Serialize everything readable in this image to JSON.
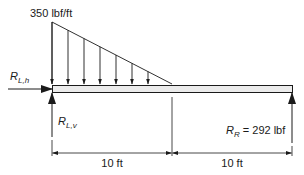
{
  "diagram": {
    "load": {
      "label": "350 lbf/ft",
      "peak_value": 350,
      "unit": "lbf/ft",
      "shape": "triangular, decreasing left to right",
      "arrow_count": 8
    },
    "reactions": {
      "left_horizontal": {
        "symbol": "R",
        "subscript": "L,h"
      },
      "left_vertical": {
        "symbol": "R",
        "subscript": "L,v"
      },
      "right": {
        "symbol": "R",
        "subscript": "R",
        "eq": " = 292 lbf",
        "value": 292,
        "unit": "lbf"
      }
    },
    "dimensions": [
      {
        "label": "10 ft",
        "value": 10,
        "unit": "ft"
      },
      {
        "label": "10 ft",
        "value": 10,
        "unit": "ft"
      }
    ],
    "colors": {
      "line": "#1a1a1a",
      "beam_fill": "#ebebeb",
      "background": "#ffffff"
    }
  }
}
